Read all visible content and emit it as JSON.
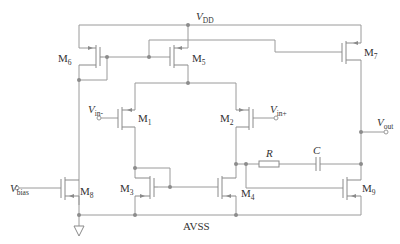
{
  "diagram": {
    "type": "circuit-schematic",
    "supply": {
      "label": "V",
      "sub": "DD"
    },
    "ground": {
      "label": "AVSS"
    },
    "inputs": [
      {
        "label": "V",
        "sub": "in-"
      },
      {
        "label": "V",
        "sub": "in+"
      },
      {
        "label": "V",
        "sub": "bias"
      }
    ],
    "output": {
      "label": "V",
      "sub": "out"
    },
    "transistors": [
      {
        "id": "M1",
        "label": "M",
        "sub": "1",
        "type": "PMOS"
      },
      {
        "id": "M2",
        "label": "M",
        "sub": "2",
        "type": "PMOS"
      },
      {
        "id": "M3",
        "label": "M",
        "sub": "3",
        "type": "NMOS"
      },
      {
        "id": "M4",
        "label": "M",
        "sub": "4",
        "type": "NMOS"
      },
      {
        "id": "M5",
        "label": "M",
        "sub": "5",
        "type": "PMOS"
      },
      {
        "id": "M6",
        "label": "M",
        "sub": "6",
        "type": "PMOS"
      },
      {
        "id": "M7",
        "label": "M",
        "sub": "7",
        "type": "PMOS"
      },
      {
        "id": "M8",
        "label": "M",
        "sub": "8",
        "type": "NMOS"
      },
      {
        "id": "M9",
        "label": "M",
        "sub": "9",
        "type": "NMOS"
      }
    ],
    "passives": [
      {
        "id": "R",
        "label": "R",
        "type": "resistor"
      },
      {
        "id": "C",
        "label": "C",
        "type": "capacitor"
      }
    ],
    "colors": {
      "wire": "#9a9a9a",
      "text": "#333333",
      "background": "#ffffff"
    }
  }
}
